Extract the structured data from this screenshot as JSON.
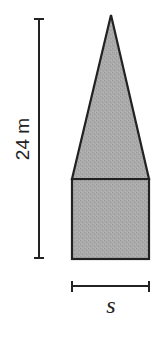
{
  "figure": {
    "title": "",
    "shape": {
      "description": "Composite shape: isosceles triangle on top of a rectangle (square base), shaded gray",
      "parts": [
        "triangle",
        "rectangle"
      ],
      "fill_color": "#a9a9a9",
      "stroke_color": "#222222"
    },
    "dimensions": {
      "height": {
        "label": "24 m",
        "value": 24,
        "unit": "m",
        "orientation": "vertical",
        "spans": "total height of shape (apex to base)"
      },
      "width": {
        "label": "s",
        "orientation": "horizontal",
        "spans": "width of base"
      }
    }
  }
}
